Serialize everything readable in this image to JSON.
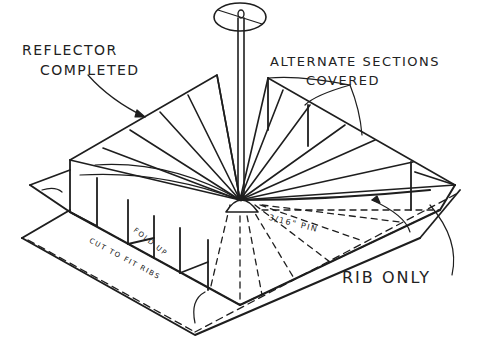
{
  "diagram": {
    "labels": {
      "reflector_line1": "REFLECTOR",
      "reflector_line2": "COMPLETED",
      "alternate_line1": "ALTERNATE SECTIONS",
      "alternate_line2": "COVERED",
      "rib_only": "RIB ONLY",
      "pin": "3/16\" PIN",
      "fold_up": "FOLD UP",
      "cut_to_fit": "CUT TO FIT RIBS"
    },
    "colors": {
      "ink": "#1e1e1e",
      "paper": "#ffffff"
    }
  }
}
